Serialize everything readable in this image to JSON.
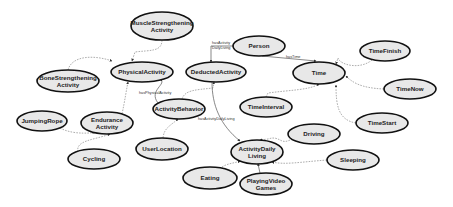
{
  "diagram": {
    "title": "",
    "nodes": [
      {
        "id": "muscle",
        "lines": [
          "MuscleStrengthening",
          "Activity"
        ],
        "cx": 162,
        "cy": 26,
        "rx": 31,
        "ry": 14
      },
      {
        "id": "physical",
        "lines": [
          "PhysicalActivity"
        ],
        "cx": 142,
        "cy": 72,
        "rx": 31,
        "ry": 10
      },
      {
        "id": "bone",
        "lines": [
          "BoneStrengthening",
          "Activity"
        ],
        "cx": 68,
        "cy": 81,
        "rx": 31,
        "ry": 11
      },
      {
        "id": "deducted",
        "lines": [
          "DeductedActivity"
        ],
        "cx": 216,
        "cy": 72,
        "rx": 30,
        "ry": 10
      },
      {
        "id": "person",
        "lines": [
          "Person"
        ],
        "cx": 259,
        "cy": 46,
        "rx": 26,
        "ry": 10
      },
      {
        "id": "time",
        "lines": [
          "Time"
        ],
        "cx": 319,
        "cy": 73,
        "rx": 26,
        "ry": 11
      },
      {
        "id": "timefinish",
        "lines": [
          "TimeFinish"
        ],
        "cx": 385,
        "cy": 51,
        "rx": 25,
        "ry": 10
      },
      {
        "id": "timenow",
        "lines": [
          "TimeNow"
        ],
        "cx": 410,
        "cy": 89,
        "rx": 26,
        "ry": 10
      },
      {
        "id": "timestart",
        "lines": [
          "TimeStart"
        ],
        "cx": 382,
        "cy": 123,
        "rx": 26,
        "ry": 10
      },
      {
        "id": "timeinterval",
        "lines": [
          "TimeInterval"
        ],
        "cx": 266,
        "cy": 107,
        "rx": 26,
        "ry": 10
      },
      {
        "id": "behavior",
        "lines": [
          "ActivityBehavior"
        ],
        "cx": 179,
        "cy": 109,
        "rx": 26,
        "ry": 10
      },
      {
        "id": "jumping",
        "lines": [
          "JumpingRope"
        ],
        "cx": 42,
        "cy": 121,
        "rx": 25,
        "ry": 10
      },
      {
        "id": "endurance",
        "lines": [
          "Endurance",
          "Activity"
        ],
        "cx": 107,
        "cy": 123,
        "rx": 26,
        "ry": 11
      },
      {
        "id": "cycling",
        "lines": [
          "Cycling"
        ],
        "cx": 94,
        "cy": 159,
        "rx": 26,
        "ry": 10
      },
      {
        "id": "userlocation",
        "lines": [
          "UserLocation"
        ],
        "cx": 162,
        "cy": 149,
        "rx": 26,
        "ry": 11
      },
      {
        "id": "driving",
        "lines": [
          "Driving"
        ],
        "cx": 314,
        "cy": 134,
        "rx": 26,
        "ry": 10
      },
      {
        "id": "adl",
        "lines": [
          "ActivityDaily",
          "Living"
        ],
        "cx": 257,
        "cy": 152,
        "rx": 26,
        "ry": 12
      },
      {
        "id": "sleeping",
        "lines": [
          "Sleeping"
        ],
        "cx": 353,
        "cy": 160,
        "rx": 26,
        "ry": 10
      },
      {
        "id": "eating",
        "lines": [
          "Eating"
        ],
        "cx": 210,
        "cy": 178,
        "rx": 27,
        "ry": 11
      },
      {
        "id": "playing",
        "lines": [
          "PlayingVideo",
          "Games"
        ],
        "cx": 266,
        "cy": 184,
        "rx": 26,
        "ry": 11
      }
    ],
    "edges": [
      {
        "from": "muscle",
        "to": "physical",
        "style": "dashed",
        "label": ""
      },
      {
        "from": "bone",
        "to": "physical",
        "style": "dashed",
        "label": ""
      },
      {
        "from": "endurance",
        "to": "physical",
        "style": "dashed",
        "label": ""
      },
      {
        "from": "behavior",
        "to": "physical",
        "style": "solid",
        "label": "hasPhysicalActivity"
      },
      {
        "from": "behavior",
        "to": "deducted",
        "style": "dashed",
        "label": ""
      },
      {
        "from": "person",
        "to": "deducted",
        "style": "solid",
        "label": "hasActivity DailyLiving"
      },
      {
        "from": "person",
        "to": "time",
        "style": "solid",
        "label": "hasTime"
      },
      {
        "from": "timefinish",
        "to": "time",
        "style": "dashed",
        "label": ""
      },
      {
        "from": "timenow",
        "to": "time",
        "style": "dashed",
        "label": ""
      },
      {
        "from": "timestart",
        "to": "time",
        "style": "dashed",
        "label": ""
      },
      {
        "from": "timeinterval",
        "to": "time",
        "style": "dashed",
        "label": ""
      },
      {
        "from": "deducted",
        "to": "adl",
        "style": "solid",
        "label": "hasActivityDailyLiving"
      },
      {
        "from": "jumping",
        "to": "endurance",
        "style": "dashed",
        "label": ""
      },
      {
        "from": "cycling",
        "to": "endurance",
        "style": "dashed",
        "label": ""
      },
      {
        "from": "userlocation",
        "to": "behavior",
        "style": "dashed",
        "label": ""
      },
      {
        "from": "driving",
        "to": "adl",
        "style": "dashed",
        "label": ""
      },
      {
        "from": "sleeping",
        "to": "adl",
        "style": "dashed",
        "label": ""
      },
      {
        "from": "eating",
        "to": "adl",
        "style": "dashed",
        "label": ""
      },
      {
        "from": "playing",
        "to": "adl",
        "style": "solid",
        "label": ""
      }
    ],
    "edge_labels": {
      "hasActivityDailyLiving_1": "hasActivity",
      "hasActivityDailyLiving_2": "DailyLiving",
      "hasTime": "hasTime",
      "hasPhysicalActivity": "hasPhysicalActivity",
      "hasActivityDailyLiving": "hasActivityDailyLiving"
    },
    "colors": {
      "node_fill": "#e8e8e8",
      "node_stroke": "#111111",
      "edge_dashed": "#8a8a8a",
      "edge_solid": "#555555",
      "background": "#ffffff"
    }
  }
}
